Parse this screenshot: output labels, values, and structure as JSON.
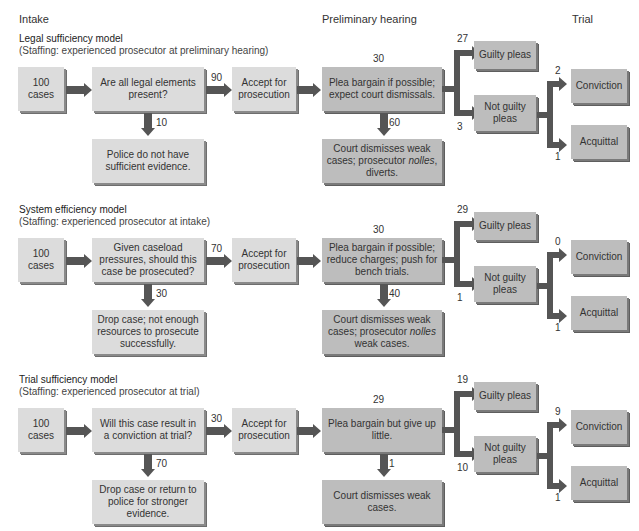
{
  "columns": {
    "intake": "Intake",
    "preliminary": "Preliminary hearing",
    "trial": "Trial"
  },
  "colors": {
    "light_box": "#dcdcdc",
    "dark_box": "#bdbdbd",
    "arrow": "#555555"
  },
  "models": [
    {
      "title": "Legal sufficiency model",
      "staffing": "(Staffing: experienced prosecutor at preliminary hearing)",
      "start": "100 cases",
      "decision": "Are all legal elements present?",
      "accept_count": "90",
      "reject_count": "10",
      "reject": "Police do not have sufficient evidence.",
      "accept": "Accept for prosecution",
      "plea_count": "30",
      "plea": "Plea bargain if possible; expect court dismissals.",
      "dismiss_count": "60",
      "dismiss_pre": "Court dismisses weak cases; prosecutor ",
      "dismiss_italic": "nolles",
      "dismiss_post": ", diverts.",
      "guilty_count": "27",
      "guilty": "Guilty pleas",
      "notguilty_count": "3",
      "notguilty": "Not guilty pleas",
      "conviction_count": "2",
      "conviction": "Conviction",
      "acquittal_count": "1",
      "acquittal": "Acquittal"
    },
    {
      "title": "System efficiency model",
      "staffing": "(Staffing: experienced prosecutor at intake)",
      "start": "100 cases",
      "decision": "Given caseload pressures, should this case be prosecuted?",
      "accept_count": "70",
      "reject_count": "30",
      "reject": "Drop case; not enough resources to prosecute successfully.",
      "accept": "Accept for prosecution",
      "plea_count": "30",
      "plea": "Plea bargain if possible; reduce charges; push for bench trials.",
      "dismiss_count": "40",
      "dismiss_pre": "Court dismisses weak cases; prosecutor ",
      "dismiss_italic": "nolles",
      "dismiss_post": " weak cases.",
      "guilty_count": "29",
      "guilty": "Guilty pleas",
      "notguilty_count": "1",
      "notguilty": "Not guilty pleas",
      "conviction_count": "0",
      "conviction": "Conviction",
      "acquittal_count": "1",
      "acquittal": "Acquittal"
    },
    {
      "title": "Trial sufficiency model",
      "staffing": "(Staffing: experienced prosecutor at trial)",
      "start": "100 cases",
      "decision": "Will this case result in a conviction at trial?",
      "accept_count": "30",
      "reject_count": "70",
      "reject": "Drop case or return to police for stronger evidence.",
      "accept": "Accept for prosecution",
      "plea_count": "29",
      "plea": "Plea bargain but give up little.",
      "dismiss_count": "1",
      "dismiss_pre": "Court dismisses weak cases.",
      "dismiss_italic": "",
      "dismiss_post": "",
      "guilty_count": "19",
      "guilty": "Guilty pleas",
      "notguilty_count": "10",
      "notguilty": "Not guilty pleas",
      "conviction_count": "9",
      "conviction": "Conviction",
      "acquittal_count": "1",
      "acquittal": "Acquittal"
    }
  ]
}
